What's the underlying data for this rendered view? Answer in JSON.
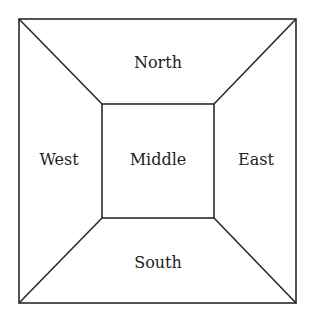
{
  "diagram": {
    "regions": {
      "north": "North",
      "south": "South",
      "east": "East",
      "west": "West",
      "middle": "Middle"
    },
    "colors": {
      "stroke": "#2a2a2a",
      "background": "#ffffff",
      "text": "#222222"
    }
  }
}
